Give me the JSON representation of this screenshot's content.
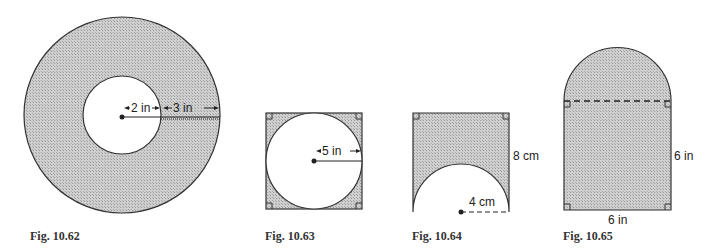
{
  "figures": [
    {
      "id": "fig-10-62",
      "caption": "Fig. 10.62",
      "shape": "annulus",
      "labels": {
        "inner_radius": "2 in",
        "ring_width": "3 in"
      }
    },
    {
      "id": "fig-10-63",
      "caption": "Fig. 10.63",
      "shape": "circle inscribed in square",
      "labels": {
        "radius": "5 in"
      }
    },
    {
      "id": "fig-10-64",
      "caption": "Fig. 10.64",
      "shape": "square with semicircle removed",
      "labels": {
        "side": "8 cm",
        "radius": "4 cm"
      }
    },
    {
      "id": "fig-10-65",
      "caption": "Fig. 10.65",
      "shape": "square with semicircle on top",
      "labels": {
        "height": "6 in",
        "width": "6 in"
      }
    }
  ],
  "colors": {
    "fill": "#c4c4c4",
    "stroke": "#333333",
    "background": "#ffffff"
  }
}
